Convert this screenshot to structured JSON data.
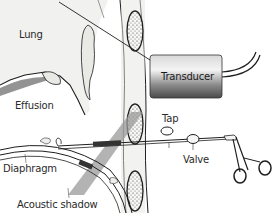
{
  "diagram": {
    "labels": {
      "lung": "Lung",
      "effusion": "Effusion",
      "transducer": "Transducer",
      "tap": "Tap",
      "valve": "Valve",
      "diaphragm": "Diaphragm",
      "acoustic_shadow": "Acoustic shadow"
    },
    "colors": {
      "line": "#1e1e1e",
      "lung_fill": "#f2f2f0",
      "rib_fill": "#f7f7f5",
      "shadow_beam": "#9a9a9a",
      "transducer_dark": "#4a4a4a",
      "transducer_light": "#e2e2e2"
    }
  }
}
